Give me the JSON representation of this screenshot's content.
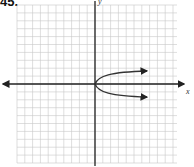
{
  "problem": {
    "number": "45."
  },
  "graph": {
    "x_axis_label": "x",
    "y_axis_label": "y",
    "grid": {
      "columns": 20,
      "rows": 20,
      "color": "#c8c8c8"
    },
    "axis_color": "#222222",
    "curve_color": "#333333",
    "curve_description": "sideways parabola opening right with vertex at origin",
    "curve_equation": "x = y^2"
  }
}
